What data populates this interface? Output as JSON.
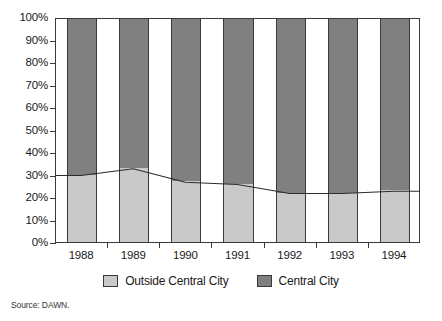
{
  "chart_data": {
    "type": "bar",
    "title": "",
    "subtitle": "",
    "xlabel": "",
    "ylabel": "",
    "categories": [
      "1988",
      "1989",
      "1990",
      "1991",
      "1992",
      "1993",
      "1994"
    ],
    "ylim": [
      0,
      100
    ],
    "y_tick_labels": [
      "0%",
      "10%",
      "20%",
      "30%",
      "40%",
      "50%",
      "60%",
      "70%",
      "80%",
      "90%",
      "100%"
    ],
    "y_tick_values": [
      0,
      10,
      20,
      30,
      40,
      50,
      60,
      70,
      80,
      90,
      100
    ],
    "grid": false,
    "stacked": true,
    "legend_position": "bottom",
    "series": [
      {
        "name": "Outside Central City",
        "color": "#c9c9c9",
        "values": [
          30,
          33,
          27,
          26,
          22,
          22,
          23
        ]
      },
      {
        "name": "Central City",
        "color": "#808080",
        "values": [
          70,
          67,
          73,
          74,
          78,
          78,
          77
        ]
      }
    ],
    "overlay_line": {
      "name": "Outside Central City trend",
      "color": "#2b2b2b",
      "values": [
        30,
        33,
        27,
        26,
        22,
        22,
        23
      ]
    },
    "annotations": []
  },
  "legend": {
    "items": [
      {
        "label": "Outside Central City",
        "color": "#c9c9c9"
      },
      {
        "label": "Central City",
        "color": "#808080"
      }
    ]
  },
  "source": {
    "text": "Source: DAWN."
  }
}
